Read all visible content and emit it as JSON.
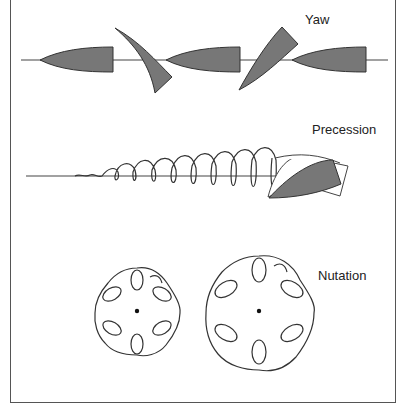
{
  "diagram": {
    "title_fragment": "",
    "panels": [
      {
        "id": "yaw",
        "label": "Yaw",
        "label_pos": [
          305,
          12
        ]
      },
      {
        "id": "precession",
        "label": "Precession",
        "label_pos": [
          312,
          122
        ]
      },
      {
        "id": "nutation",
        "label": "Nutation",
        "label_pos": [
          318,
          268
        ]
      }
    ],
    "colors": {
      "boat_fill": "#777777",
      "stroke": "#333333",
      "frame": "#555555",
      "background": "#ffffff"
    }
  }
}
